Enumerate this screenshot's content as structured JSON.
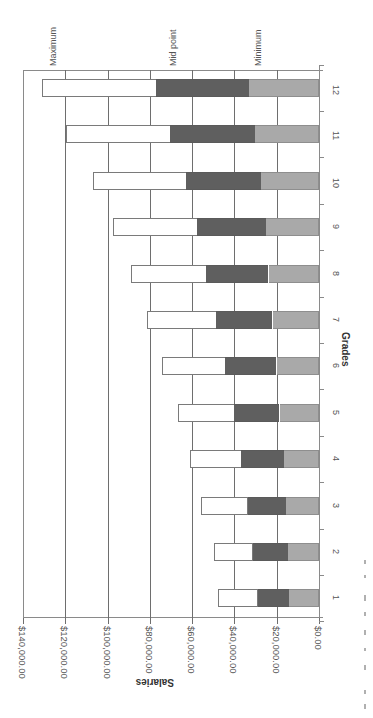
{
  "chart_data": {
    "type": "bar",
    "orientation": "stacked bar chart, page rotated 90 degrees clockwise",
    "title": "",
    "xlabel": "Grades",
    "ylabel": "Salaries",
    "categories": [
      "1",
      "2",
      "3",
      "4",
      "5",
      "6",
      "7",
      "8",
      "9",
      "10",
      "11",
      "12"
    ],
    "series": [
      {
        "name": "Minimum",
        "color": "#a9a9a9",
        "values": [
          14300,
          14800,
          15700,
          16700,
          18600,
          20000,
          21900,
          23800,
          25200,
          27600,
          30500,
          33000
        ]
      },
      {
        "name": "Mid point",
        "color": "#5f5f5f",
        "values": [
          29000,
          31400,
          33800,
          37000,
          40000,
          44300,
          48600,
          53300,
          57600,
          62900,
          70500,
          77000
        ]
      },
      {
        "name": "Maximum",
        "color": "#ffffff",
        "values": [
          47600,
          49500,
          55700,
          61000,
          66700,
          74300,
          81400,
          89000,
          97600,
          107000,
          119500,
          131000
        ]
      }
    ],
    "ylim": [
      0,
      140000
    ],
    "yticks": [
      0,
      20000,
      40000,
      60000,
      80000,
      100000,
      120000,
      140000
    ],
    "ytick_labels": [
      "$0.00",
      "$20,000.00",
      "$40,000.00",
      "$60,000.00",
      "$80,000.00",
      "$100,000.00",
      "$120,000.00",
      "$140,000.00"
    ],
    "annotations": [
      "Maximum",
      "Mid point",
      "Minimum"
    ],
    "grid": true,
    "legend": "none (series labeled by annotations above grade 12 bar)"
  },
  "labels": {
    "yaxis_title": "Salaries",
    "xaxis_title": "Grades",
    "annot_max": "Maximum",
    "annot_mid": "Mid point",
    "annot_min": "Minimum"
  }
}
